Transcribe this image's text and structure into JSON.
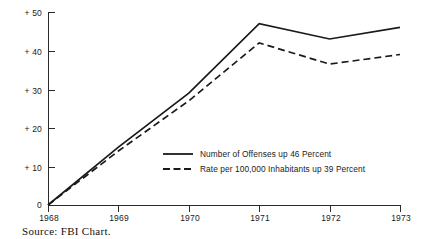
{
  "chart_data": {
    "type": "line",
    "title": "",
    "subtitle": "",
    "xlabel": "",
    "ylabel": "",
    "x": [
      "1968",
      "1969",
      "1970",
      "1971",
      "1972",
      "1973"
    ],
    "categories": [
      "1968",
      "1969",
      "1970",
      "1971",
      "1972",
      "1973"
    ],
    "series": [
      {
        "name": "Number of Offenses up 46 Percent",
        "style": "solid",
        "values": [
          0,
          15,
          29,
          47,
          43,
          46
        ]
      },
      {
        "name": "Rate per 100,000 Inhabitants up 39 Percent",
        "style": "dashed",
        "values": [
          0,
          14,
          27,
          42,
          36.5,
          39
        ]
      }
    ],
    "ylim": [
      0,
      50
    ],
    "yticks": [
      0,
      10,
      20,
      30,
      40,
      50
    ],
    "ytick_labels": [
      "0",
      "+ 10",
      "+ 20",
      "+ 30",
      "+ 40",
      "+ 50"
    ],
    "xtick_labels": [
      "1968",
      "1969",
      "1970",
      "1971",
      "1972",
      "1973"
    ],
    "grid": false,
    "legend_position": "center-right-inside",
    "annotations": []
  },
  "legend": {
    "entries": [
      {
        "label": "Number of Offenses up 46 Percent",
        "style": "solid"
      },
      {
        "label": "Rate per 100,000 Inhabitants up 39 Percent",
        "style": "dashed"
      }
    ]
  },
  "footer": {
    "source": "Source:  FBI  Chart."
  },
  "colors": {
    "ink": "#1a1a1a",
    "axis": "#2b2b2b",
    "background": "#ffffff"
  }
}
